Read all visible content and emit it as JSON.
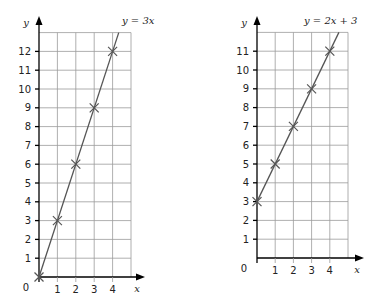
{
  "chart_data": [
    {
      "type": "line",
      "title": "y = 3x",
      "equation_label": "y = 3x",
      "xlabel": "x",
      "ylabel": "y",
      "origin_label": "0",
      "x_ticks": [
        1,
        2,
        3,
        4
      ],
      "y_ticks": [
        1,
        2,
        3,
        4,
        5,
        6,
        7,
        8,
        9,
        10,
        11,
        12
      ],
      "xlim": [
        0,
        5
      ],
      "ylim": [
        0,
        13
      ],
      "grid": true,
      "points": [
        {
          "x": 0,
          "y": 0
        },
        {
          "x": 1,
          "y": 3
        },
        {
          "x": 2,
          "y": 6
        },
        {
          "x": 3,
          "y": 9
        },
        {
          "x": 4,
          "y": 12
        }
      ],
      "marker": "cross"
    },
    {
      "type": "line",
      "title": "y = 2x + 3",
      "equation_label": "y = 2x + 3",
      "xlabel": "x",
      "ylabel": "y",
      "origin_label": "0",
      "x_ticks": [
        1,
        2,
        3,
        4
      ],
      "y_ticks": [
        1,
        2,
        3,
        4,
        5,
        6,
        7,
        8,
        9,
        10,
        11
      ],
      "xlim": [
        0,
        5
      ],
      "ylim": [
        0,
        12
      ],
      "grid": true,
      "points": [
        {
          "x": 0,
          "y": 3
        },
        {
          "x": 1,
          "y": 5
        },
        {
          "x": 2,
          "y": 7
        },
        {
          "x": 3,
          "y": 9
        },
        {
          "x": 4,
          "y": 11
        }
      ],
      "marker": "cross"
    }
  ],
  "layout": [
    {
      "ox": 39,
      "oy": 277,
      "ux": 18.4,
      "uy": 18.8,
      "eq_x": 122,
      "eq_y": 24,
      "xlabel_x": 137,
      "xlabel_y": 292,
      "arrow_x": 145,
      "arrow_y": 16
    },
    {
      "ox": 257,
      "oy": 258,
      "ux": 18.2,
      "uy": 18.8,
      "eq_x": 304,
      "eq_y": 24,
      "xlabel_x": 357,
      "xlabel_y": 273,
      "arrow_x": 364,
      "arrow_y": 16
    }
  ],
  "colors": {
    "grid": "#9a9a9a",
    "axis": "#000000",
    "line": "#555555"
  }
}
